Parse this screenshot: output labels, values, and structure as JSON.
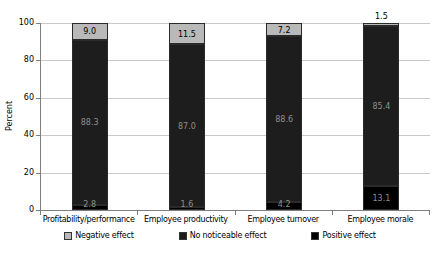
{
  "chart_data": {
    "type": "bar",
    "stacked": true,
    "title": "",
    "xlabel": "",
    "ylabel": "Percent",
    "ylim": [
      0,
      100
    ],
    "yticks": [
      0,
      20,
      40,
      60,
      80,
      100
    ],
    "grid": true,
    "legend_position": "bottom",
    "categories": [
      "Profitability/performance",
      "Employee productivity",
      "Employee turnover",
      "Employee morale"
    ],
    "series": [
      {
        "name": "Positive effect",
        "color": "#000000",
        "label_color": "#8f8f8f",
        "values": [
          2.8,
          1.6,
          4.2,
          13.1
        ]
      },
      {
        "name": "No noticeable effect",
        "color": "#1d1d1d",
        "label_color": "#8f8f8f",
        "values": [
          88.3,
          87.0,
          88.6,
          85.4
        ]
      },
      {
        "name": "Negative effect",
        "color": "#b9b9b9",
        "label_color": "#000000",
        "values": [
          9.0,
          11.5,
          7.2,
          1.5
        ]
      }
    ],
    "legend_order": [
      "Negative effect",
      "No noticeable effect",
      "Positive effect"
    ],
    "outside_label_color": "#000000"
  }
}
